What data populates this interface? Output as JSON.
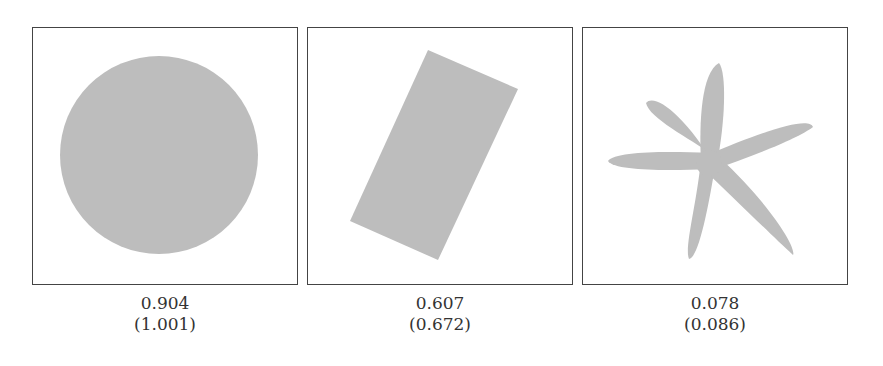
{
  "figure": {
    "fill_color": "#bdbdbd",
    "border_color": "#444444",
    "panels": [
      {
        "shape": "circle",
        "value": "0.904",
        "value_paren": "(1.001)"
      },
      {
        "shape": "rotated-rectangle",
        "value": "0.607",
        "value_paren": "(0.672)"
      },
      {
        "shape": "six-petal-star",
        "value": "0.078",
        "value_paren": "(0.086)"
      }
    ]
  }
}
